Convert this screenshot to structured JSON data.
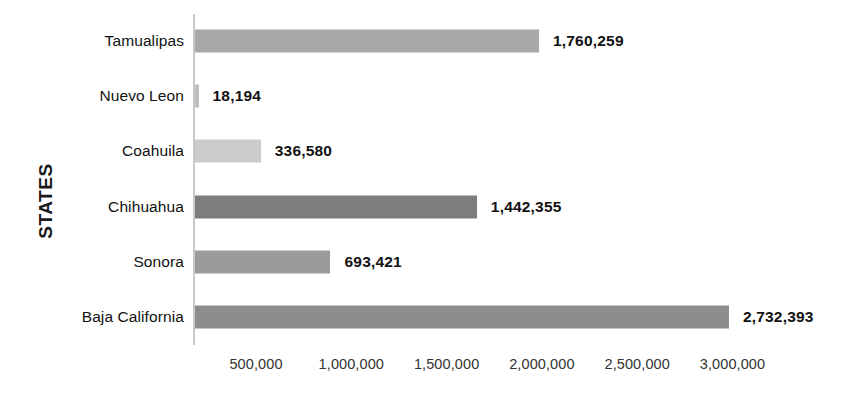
{
  "chart_data": {
    "type": "bar",
    "orientation": "horizontal",
    "title": "",
    "xlabel": "",
    "ylabel": "STATES",
    "categories": [
      "Tamualipas",
      "Nuevo Leon",
      "Coahuila",
      "Chihuahua",
      "Sonora",
      "Baja California"
    ],
    "values": [
      1760259,
      18194,
      336580,
      1442355,
      693421,
      2732393
    ],
    "value_labels": [
      "1,760,259",
      "18,194",
      "336,580",
      "1,442,355",
      "693,421",
      "2,732,393"
    ],
    "bar_colors": [
      "#a8a8a8",
      "#c0c0c0",
      "#cccccc",
      "#7d7d7d",
      "#9b9b9b",
      "#8d8d8d"
    ],
    "xlim": [
      0,
      3100000
    ],
    "xticks": [
      500000,
      1000000,
      1500000,
      2000000,
      2500000,
      3000000
    ],
    "xtick_labels": [
      "500,000",
      "1,000,000",
      "1,500,000",
      "2,000,000",
      "2,500,000",
      "3,000,000"
    ],
    "grid": false,
    "legend": "none",
    "axis_line_color": "#c8c8c8",
    "background_color": "#ffffff",
    "text_color": "#111111"
  },
  "axis": {
    "y_title": "STATES"
  }
}
